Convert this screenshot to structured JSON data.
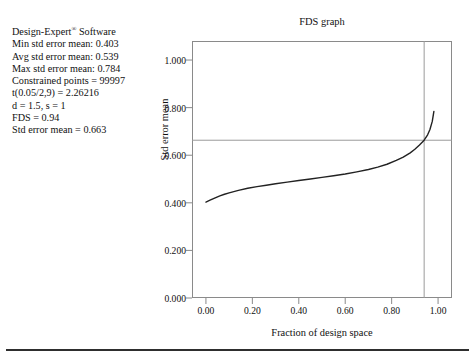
{
  "info": {
    "lines": [
      "Design-Expert® Software",
      "Min std error mean: 0.403",
      "Avg std error mean: 0.539",
      "Max std error mean: 0.784",
      "Constrained points = 99997",
      "t(0.05/2,9) = 2.26216",
      "d = 1.5, s = 1",
      "FDS = 0.94",
      "Std error mean = 0.663"
    ]
  },
  "chart_data": {
    "type": "line",
    "title": "FDS graph",
    "xlabel": "Fraction of design space",
    "ylabel": "Std error mean",
    "xlim": [
      -0.06,
      1.06
    ],
    "ylim": [
      0.0,
      1.08
    ],
    "grid": false,
    "xticks": [
      0.0,
      0.2,
      0.4,
      0.6,
      0.8,
      1.0
    ],
    "xticklabels": [
      "0.00",
      "0.20",
      "0.40",
      "0.60",
      "0.80",
      "1.00"
    ],
    "yticks": [
      0.0,
      0.2,
      0.4,
      0.6,
      0.8,
      1.0
    ],
    "yticklabels": [
      "0.000",
      "0.200",
      "0.400",
      "0.600",
      "0.800",
      "1.000"
    ],
    "series": [
      {
        "name": "FDS curve",
        "color": "#222222",
        "x": [
          0.0,
          0.02,
          0.04,
          0.06,
          0.08,
          0.1,
          0.14,
          0.18,
          0.22,
          0.26,
          0.3,
          0.35,
          0.4,
          0.45,
          0.5,
          0.55,
          0.6,
          0.65,
          0.7,
          0.74,
          0.78,
          0.82,
          0.85,
          0.88,
          0.9,
          0.92,
          0.94,
          0.955,
          0.965,
          0.975,
          0.982
        ],
        "y": [
          0.403,
          0.412,
          0.421,
          0.429,
          0.436,
          0.442,
          0.452,
          0.461,
          0.468,
          0.474,
          0.48,
          0.487,
          0.494,
          0.5,
          0.507,
          0.514,
          0.521,
          0.53,
          0.54,
          0.55,
          0.562,
          0.578,
          0.592,
          0.61,
          0.625,
          0.643,
          0.663,
          0.686,
          0.708,
          0.742,
          0.784
        ]
      }
    ],
    "annotations": [
      {
        "name": "fds-vertical-marker",
        "type": "vline",
        "x": 0.94,
        "color": "#9a9a9a",
        "label": "FDS = 0.94"
      },
      {
        "name": "std-error-horizontal-marker",
        "type": "hline",
        "y": 0.663,
        "color": "#9a9a9a",
        "label": "Std error mean = 0.663"
      }
    ]
  }
}
